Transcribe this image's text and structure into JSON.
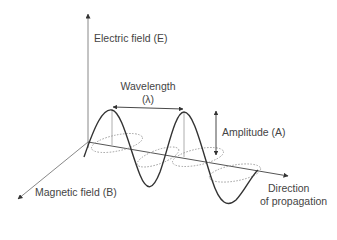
{
  "diagram": {
    "labels": {
      "electric_field": "Electric field (E)",
      "wavelength": "Wavelength",
      "wavelength_symbol": "(λ)",
      "amplitude": "Amplitude (A)",
      "magnetic_field": "Magnetic field (B)",
      "direction_line1": "Direction",
      "direction_line2": "of propagation"
    },
    "colors": {
      "axis": "#555555",
      "wave": "#333333",
      "magnetic_wave": "#888888",
      "text": "#444444"
    }
  }
}
